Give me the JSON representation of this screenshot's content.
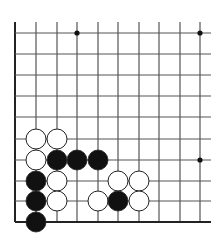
{
  "board": {
    "description": "Go board fragment (bottom-left corner region)",
    "columns_x": [
      15,
      36,
      57,
      77,
      98,
      118,
      139,
      159,
      180,
      200
    ],
    "rows_y": [
      33,
      54,
      75,
      96,
      117,
      139,
      160,
      181,
      201,
      222
    ],
    "line_color": "#555555",
    "edge_line_color": "#222222",
    "vertical_line_top": 22,
    "horizontal_line_right": 211,
    "stone_radius": 10,
    "star_points": [
      [
        3,
        0
      ],
      [
        9,
        0
      ],
      [
        9,
        6
      ]
    ],
    "stones": [
      {
        "color": "white",
        "col": 1,
        "row": 5
      },
      {
        "color": "white",
        "col": 2,
        "row": 5
      },
      {
        "color": "white",
        "col": 1,
        "row": 6
      },
      {
        "color": "black",
        "col": 2,
        "row": 6
      },
      {
        "color": "black",
        "col": 3,
        "row": 6
      },
      {
        "color": "black",
        "col": 4,
        "row": 6
      },
      {
        "color": "black",
        "col": 1,
        "row": 7
      },
      {
        "color": "white",
        "col": 2,
        "row": 7
      },
      {
        "color": "white",
        "col": 5,
        "row": 7
      },
      {
        "color": "white",
        "col": 6,
        "row": 7
      },
      {
        "color": "black",
        "col": 1,
        "row": 8
      },
      {
        "color": "white",
        "col": 2,
        "row": 8
      },
      {
        "color": "white",
        "col": 4,
        "row": 8
      },
      {
        "color": "black",
        "col": 5,
        "row": 8
      },
      {
        "color": "white",
        "col": 6,
        "row": 8
      },
      {
        "color": "black",
        "col": 1,
        "row": 9
      }
    ],
    "colors": {
      "black_stone": "#111111",
      "white_stone": "#ffffff",
      "stone_border": "#222222"
    }
  }
}
